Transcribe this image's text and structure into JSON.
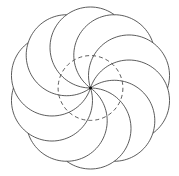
{
  "diagram": {
    "type": "swirl-rosette",
    "arc_count": 10,
    "rotation_step_degrees": 36,
    "arc_sweep_degrees": 216,
    "swirl_direction": "counterclockwise",
    "inner_circle": {
      "style": "dashed",
      "radius_ratio_to_outer": 0.4
    },
    "center_point": {
      "shown": true
    },
    "colors": {
      "stroke": "#4a4a4a",
      "center_dot": "#111111",
      "background": "#ffffff"
    }
  }
}
